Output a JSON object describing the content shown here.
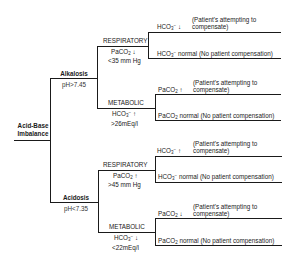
{
  "diagram": {
    "root": {
      "line1": "Acid-Base",
      "line2": "Imbalance"
    },
    "alkalosis": {
      "label": "Alkalosis",
      "ph": "pH>7.45",
      "respiratory": {
        "label": "RESPIRATORY",
        "indicator_1": "PaCO",
        "indicator_1_sub": "2",
        "indicator_1_arrow": "↓",
        "indicator_2": "<35 mm Hg",
        "compensated": {
          "value": "HCO",
          "sub": "3",
          "sup": "−",
          "arrow": "↓",
          "note_1": "(Patient's attempting to",
          "note_2": "compensate)"
        },
        "uncompensated": {
          "value": "HCO",
          "sub": "3",
          "sup": "−",
          "text": " normal (No patient compensation)"
        }
      },
      "metabolic": {
        "label": "METABOLIC",
        "indicator_1": "HCO",
        "indicator_1_sub": "3",
        "indicator_1_sup": "−",
        "indicator_1_arrow": "↑",
        "indicator_2": ">26mEq/l",
        "compensated": {
          "value": "PaCO",
          "sub": "2",
          "arrow": "↑",
          "note_1": "(Patient's attempting to",
          "note_2": "compensate)"
        },
        "uncompensated": {
          "value": "PaCO",
          "sub": "2",
          "text": " normal (No patient compensation)"
        }
      }
    },
    "acidosis": {
      "label": "Acidosis",
      "ph": "pH<7.35",
      "respiratory": {
        "label": "RESPIRATORY",
        "indicator_1": "PaCO",
        "indicator_1_sub": "2",
        "indicator_1_arrow": "↑",
        "indicator_2": ">45 mm Hg",
        "compensated": {
          "value": "HCO",
          "sub": "3",
          "sup": "−",
          "arrow": "↑",
          "note_1": "(Patient's attempting to",
          "note_2": "compensate)"
        },
        "uncompensated": {
          "value": "HCO",
          "sub": "3",
          "sup": "−",
          "text": "  normal (No patient compensation)"
        }
      },
      "metabolic": {
        "label": "METABOLIC",
        "indicator_1": "HCO",
        "indicator_1_sub": "3",
        "indicator_1_sup": "−",
        "indicator_1_arrow": "↓",
        "indicator_2": "<22mEq/l",
        "compensated": {
          "value": "PaCO",
          "sub": "2",
          "arrow": "↓",
          "note_1": "(Patient's attempting to",
          "note_2": "compensate)"
        },
        "uncompensated": {
          "value": "PaCO",
          "sub": "2",
          "text": "  normal (No patient compensation)"
        }
      }
    }
  }
}
